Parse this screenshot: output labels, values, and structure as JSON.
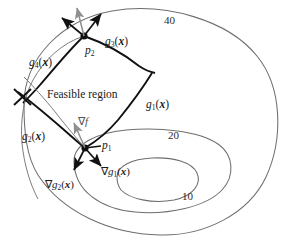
{
  "figure": {
    "type": "diagram",
    "title_text": "",
    "background_color": "#ffffff",
    "ink_color": "#1a1a1a",
    "contour_color": "#6e6e6e",
    "constraint_color": "#111111",
    "objf_arrow_color": "#8a8a8a"
  },
  "contours": {
    "label_text": "objective function contour levels",
    "levels": [
      {
        "value": "40",
        "x": 164,
        "y": 15
      },
      {
        "value": "20",
        "x": 168,
        "y": 130
      },
      {
        "value": "10",
        "x": 182,
        "y": 191
      }
    ]
  },
  "constraints": [
    {
      "id": "g1",
      "label": "g",
      "index": "1",
      "arg": "x",
      "x": 146,
      "y": 99
    },
    {
      "id": "g2",
      "label": "g",
      "index": "2",
      "arg": "x",
      "x": 22,
      "y": 131
    },
    {
      "id": "g3",
      "label": "g",
      "index": "3",
      "arg": "x",
      "x": 105,
      "y": 36
    },
    {
      "id": "g4",
      "label": "g",
      "index": "4",
      "arg": "x",
      "x": 29,
      "y": 57
    }
  ],
  "points": [
    {
      "id": "p1",
      "label": "p",
      "index": "1",
      "label_x": 102,
      "label_y": 140,
      "cx": 85,
      "cy": 148
    },
    {
      "id": "p2",
      "label": "p",
      "index": "2",
      "label_x": 85,
      "label_y": 45,
      "cx": 84,
      "cy": 36
    }
  ],
  "region": {
    "label": "Feasible region",
    "x": 47,
    "y": 89
  },
  "gradients": [
    {
      "id": "grad-f",
      "symbol": "∇",
      "fn": "f",
      "x": 78,
      "y": 116,
      "color": "#8a8a8a"
    },
    {
      "id": "grad-g1",
      "symbol": "∇",
      "fn": "g",
      "index": "1",
      "arg": "x",
      "x": 101,
      "y": 166
    },
    {
      "id": "grad-g2",
      "symbol": "∇",
      "fn": "g",
      "index": "2",
      "arg": "x",
      "x": 45,
      "y": 179
    }
  ]
}
